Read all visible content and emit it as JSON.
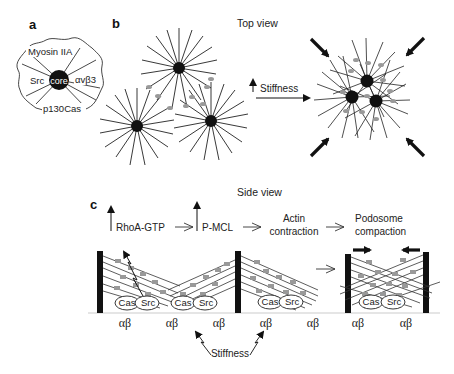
{
  "panels": {
    "a": {
      "label": "a",
      "core_label": "core",
      "components": [
        "Myosin IIA",
        "Src",
        "αvβ3",
        "p130Cas"
      ]
    },
    "b": {
      "label": "b",
      "title": "Top view",
      "stiffness_label": "Stiffness"
    },
    "c": {
      "label": "c",
      "title": "Side view",
      "steps": [
        "RhoA-GTP",
        "P-MCL",
        "Actin contraction",
        "Podosome compaction"
      ],
      "step_actin_line1": "Actin",
      "step_actin_line2": "contraction",
      "step_podo_line1": "Podosome",
      "step_podo_line2": "compaction",
      "cas_label": "Cas",
      "src_label": "Src",
      "integrin_label": "αβ",
      "stiffness_label": "Stiffness"
    }
  },
  "colors": {
    "ink": "#111111",
    "myosin_grey": "#9a9a9a",
    "background": "#ffffff"
  }
}
